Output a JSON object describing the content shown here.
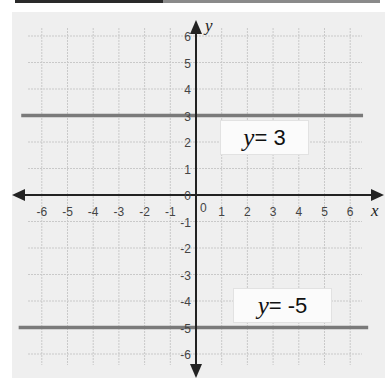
{
  "chart_data": {
    "type": "line",
    "title": "",
    "xlabel": "x",
    "ylabel": "y",
    "xlim": [
      -6,
      6
    ],
    "ylim": [
      -6,
      6
    ],
    "grid": true,
    "x_ticks": [
      "-6",
      "-5",
      "-4",
      "-3",
      "-2",
      "-1",
      "1",
      "2",
      "3",
      "4",
      "5",
      "6"
    ],
    "y_ticks": [
      "6",
      "5",
      "4",
      "3",
      "2",
      "1",
      "0",
      "-1",
      "-2",
      "-3",
      "-4",
      "-5",
      "-6"
    ],
    "origin_label": "0",
    "series": [
      {
        "name": "y= 3",
        "equation": "y = 3",
        "x": [
          -6.8,
          6.5
        ],
        "y": [
          3,
          3
        ],
        "color": "#7a7a7a"
      },
      {
        "name": "y= -5",
        "equation": "y = -5",
        "x": [
          -6.9,
          6.7
        ],
        "y": [
          -5,
          -5
        ],
        "color": "#7a7a7a"
      }
    ],
    "annotations": [
      {
        "text_var": "y",
        "text_rest": "= 3",
        "near": [
          2,
          2.5
        ]
      },
      {
        "text_var": "y",
        "text_rest": "= -5",
        "near": [
          2.5,
          -4
        ]
      }
    ]
  },
  "labels": {
    "eq1_var": "y",
    "eq1_rest": "= 3",
    "eq2_var": "y",
    "eq2_rest": "= -5",
    "x_axis": "x",
    "y_axis": "y",
    "origin": "0"
  }
}
